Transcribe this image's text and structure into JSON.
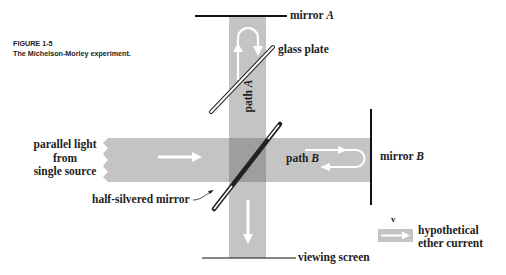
{
  "figure": {
    "number": "FIGURE 1-5",
    "title": "The Michelson-Morley experiment."
  },
  "labels": {
    "mirror_a": "mirror ",
    "mirror_a_letter": "A",
    "glass_plate": "glass plate",
    "path_a": "path ",
    "path_a_letter": "A",
    "source_line1": "parallel light",
    "source_line2": "from",
    "source_line3": "single source",
    "path_b": "path ",
    "path_b_letter": "B",
    "mirror_b": "mirror ",
    "mirror_b_letter": "B",
    "half_silvered_mirror": "half-silvered mirror",
    "velocity_symbol": "v",
    "ether_line1": "hypothetical",
    "ether_line2": "ether current",
    "viewing_screen": "viewing screen"
  },
  "colors": {
    "beam": "#c4c4c4",
    "beam_overlap": "#9a9a9a",
    "ink": "#111111",
    "arrow": "#ffffff"
  }
}
